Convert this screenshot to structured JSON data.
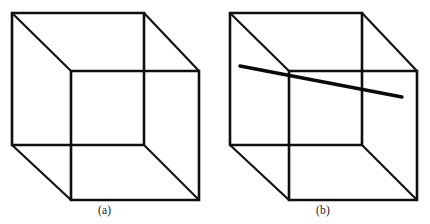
{
  "figure": {
    "background_color": "#ffffff",
    "ink_color": "#0f0f10",
    "width": 430,
    "height": 224,
    "panels": [
      {
        "id": "panel-a",
        "caption": "(a)",
        "description": "Necker cube wireframe, no occluding line",
        "origin_x": 0,
        "cube": {
          "back_face": [
            [
              12,
              13
            ],
            [
              144,
              13
            ],
            [
              144,
              145
            ],
            [
              12,
              145
            ]
          ],
          "front_face": [
            [
              71,
              71
            ],
            [
              199,
              71
            ],
            [
              199,
              200
            ],
            [
              71,
              200
            ]
          ],
          "connectors": [
            [
              [
                12,
                13
              ],
              [
                71,
                71
              ]
            ],
            [
              [
                144,
                13
              ],
              [
                199,
                71
              ]
            ],
            [
              [
                144,
                145
              ],
              [
                199,
                200
              ]
            ],
            [
              [
                12,
                145
              ],
              [
                71,
                200
              ]
            ]
          ]
        },
        "overlay_line": null
      },
      {
        "id": "panel-b",
        "caption": "(b)",
        "description": "Necker cube wireframe with a straight line crossing the near vertex",
        "origin_x": 218,
        "cube": {
          "back_face": [
            [
              230,
              13
            ],
            [
              362,
              13
            ],
            [
              362,
              145
            ],
            [
              230,
              145
            ]
          ],
          "front_face": [
            [
              289,
              71
            ],
            [
              417,
              71
            ],
            [
              417,
              200
            ],
            [
              289,
              200
            ]
          ],
          "connectors": [
            [
              [
                230,
                13
              ],
              [
                289,
                71
              ]
            ],
            [
              [
                362,
                13
              ],
              [
                417,
                71
              ]
            ],
            [
              [
                362,
                145
              ],
              [
                417,
                200
              ]
            ],
            [
              [
                230,
                145
              ],
              [
                289,
                200
              ]
            ]
          ]
        },
        "overlay_line": {
          "start": [
            240,
            66
          ],
          "end": [
            402,
            97
          ],
          "stroke_width": 3.4,
          "passes_through_vertex": [
            291,
            71
          ]
        }
      }
    ]
  }
}
